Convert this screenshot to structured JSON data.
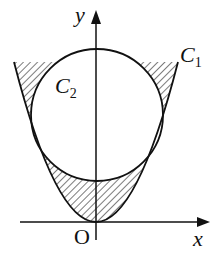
{
  "figure": {
    "axis_x_label": "x",
    "axis_y_label": "y",
    "origin_label": "O",
    "curve1": {
      "letter": "C",
      "subscript": "1"
    },
    "curve2": {
      "letter": "C",
      "subscript": "2"
    },
    "colors": {
      "stroke": "#111111",
      "background": "#ffffff"
    }
  }
}
